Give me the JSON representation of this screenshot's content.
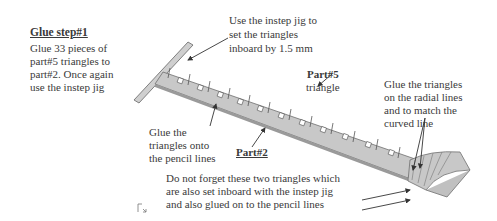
{
  "step_title": "Glue step#1",
  "step_text": [
    "Glue 33 pieces of",
    "part#5 triangles to",
    "part#2. Once again",
    "use the instep jig"
  ],
  "callouts": {
    "instep_jig": [
      "Use the instep jig to",
      "set the triangles",
      "inboard by 1.5 mm"
    ],
    "part5_label": "Part#5",
    "part5_sub": "triangle",
    "radial": [
      "Glue the triangles",
      "on the radial lines",
      "and to match the",
      "curved line"
    ],
    "pencil": [
      "Glue the",
      "triangles onto",
      "the pencil lines"
    ],
    "part2_label": "Part#2",
    "two_triangles": [
      "Do not forget these two triangles which",
      "are also set inboard with the instep jig",
      "and also glued on to the pencil lines"
    ]
  },
  "colors": {
    "strip_fill": "#c8c8c8",
    "strip_edge": "#6e6e6e",
    "arrow": "#333333",
    "text": "#3a3a3a"
  }
}
